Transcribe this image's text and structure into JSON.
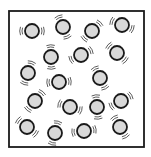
{
  "diagram": {
    "container": {
      "x": 9,
      "y": 11,
      "width": 135,
      "height": 136,
      "stroke": "#1a1a1a",
      "stroke_width": 1.8
    },
    "particle_style": {
      "radius": 7,
      "fill": "#d9d9d9",
      "stroke": "#1a1a1a",
      "stroke_width": 1.8,
      "motion_mark_color": "#333333"
    },
    "particles": [
      {
        "cx": 32,
        "cy": 31
      },
      {
        "cx": 63,
        "cy": 27
      },
      {
        "cx": 92,
        "cy": 31
      },
      {
        "cx": 122,
        "cy": 25
      },
      {
        "cx": 51,
        "cy": 57
      },
      {
        "cx": 81,
        "cy": 55
      },
      {
        "cx": 117,
        "cy": 53
      },
      {
        "cx": 28,
        "cy": 73
      },
      {
        "cx": 59,
        "cy": 82
      },
      {
        "cx": 100,
        "cy": 78
      },
      {
        "cx": 35,
        "cy": 101
      },
      {
        "cx": 70,
        "cy": 107
      },
      {
        "cx": 97,
        "cy": 107
      },
      {
        "cx": 121,
        "cy": 101
      },
      {
        "cx": 27,
        "cy": 127
      },
      {
        "cx": 55,
        "cy": 133
      },
      {
        "cx": 84,
        "cy": 131
      },
      {
        "cx": 120,
        "cy": 127
      }
    ]
  }
}
